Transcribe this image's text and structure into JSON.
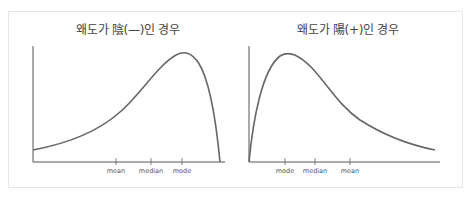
{
  "diagrams": [
    {
      "id": "negative-skew",
      "title": "왜도가 陰(—)인 경우",
      "ticks": [
        {
          "label": "mean"
        },
        {
          "label": "median"
        },
        {
          "label": "mode"
        }
      ]
    },
    {
      "id": "positive-skew",
      "title": "왜도가 陽(+)인 경우",
      "ticks": [
        {
          "label": "mode"
        },
        {
          "label": "median"
        },
        {
          "label": "mean"
        }
      ]
    }
  ],
  "colors": {
    "axis": "#555555",
    "curve": "#666666",
    "frame": "#e6e6e6",
    "text": "#444444"
  }
}
